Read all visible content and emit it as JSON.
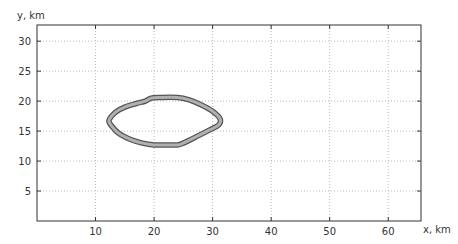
{
  "chart_data": {
    "type": "line",
    "title": "",
    "xlabel": "x, km",
    "ylabel": "y, km",
    "xlim": [
      0,
      65.6
    ],
    "ylim": [
      0,
      32.7
    ],
    "xticks": [
      10,
      20,
      30,
      40,
      50,
      60
    ],
    "yticks": [
      5,
      10,
      15,
      20,
      25,
      30
    ],
    "grid": true,
    "legend": null,
    "series": [
      {
        "name": "contour",
        "style": "closed filled ring (dark outline, light gray band)",
        "outline_color": "#555555",
        "fill_color": "#b0b0b0",
        "x": [
          12.3,
          13.5,
          15.0,
          17.0,
          18.5,
          19.5,
          21.0,
          24.0,
          26.0,
          28.0,
          30.0,
          31.3,
          31.0,
          29.5,
          27.5,
          25.0,
          24.0,
          22.0,
          20.0,
          18.0,
          16.0,
          14.0,
          12.8,
          12.3
        ],
        "y": [
          16.8,
          18.2,
          19.0,
          19.6,
          20.0,
          20.5,
          20.6,
          20.6,
          20.2,
          19.4,
          18.3,
          17.0,
          16.0,
          15.2,
          14.2,
          13.0,
          12.7,
          12.7,
          12.7,
          13.0,
          13.6,
          14.6,
          15.8,
          16.8
        ]
      }
    ]
  },
  "colors": {
    "axis": "#333333",
    "grid": "#bbbbbb",
    "ring_outline": "#555555",
    "ring_fill": "#b0b0b0"
  }
}
